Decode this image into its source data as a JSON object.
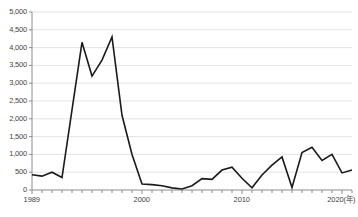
{
  "chart_data": {
    "type": "line",
    "title": "",
    "subtitle": "",
    "xlabel": "(年)",
    "ylabel": "",
    "grid": true,
    "legend": null,
    "xlim": [
      1989,
      2021
    ],
    "ylim": [
      0,
      5000
    ],
    "y_ticks": [
      0,
      500,
      1000,
      1500,
      2000,
      2500,
      3000,
      3500,
      4000,
      4500,
      5000
    ],
    "y_tick_labels": [
      "0",
      "500",
      "1,000",
      "1,500",
      "2,000",
      "2,500",
      "3,000",
      "3,500",
      "4,000",
      "4,500",
      "5,000"
    ],
    "x_tick_labels": [
      "1989",
      "2000",
      "2010",
      "2020(年)"
    ],
    "x_labeled_years": [
      1989,
      2000,
      2010,
      2020
    ],
    "x_minor_tick_interval": 1,
    "x": [
      1989,
      1990,
      1991,
      1992,
      1993,
      1994,
      1995,
      1996,
      1997,
      1998,
      1999,
      2000,
      2001,
      2002,
      2003,
      2004,
      2005,
      2006,
      2007,
      2008,
      2009,
      2010,
      2011,
      2012,
      2013,
      2014,
      2015,
      2016,
      2017,
      2018,
      2019,
      2020,
      2021
    ],
    "values": [
      430,
      390,
      500,
      350,
      2250,
      4150,
      3200,
      3650,
      4300,
      2100,
      1000,
      170,
      150,
      120,
      60,
      30,
      120,
      320,
      300,
      560,
      640,
      330,
      60,
      420,
      700,
      930,
      70,
      1050,
      1200,
      830,
      1000,
      480,
      560
    ],
    "series": [
      {
        "name": "",
        "color": "#1a1a1a",
        "values": [
          430,
          390,
          500,
          350,
          2250,
          4150,
          3200,
          3650,
          4300,
          2100,
          1000,
          170,
          150,
          120,
          60,
          30,
          120,
          320,
          300,
          560,
          640,
          330,
          60,
          420,
          700,
          930,
          70,
          1050,
          1200,
          830,
          1000,
          480,
          560
        ]
      }
    ],
    "axis_color": "#888888",
    "grid_color": "#d8d8d8",
    "line_color": "#1a1a1a",
    "line_width": 1.6
  },
  "axes": {
    "y_labels": [
      "5,000",
      "4,500",
      "4,000",
      "3,500",
      "3,000",
      "2,500",
      "2,000",
      "1,500",
      "1,000",
      "500",
      "0"
    ],
    "x_labels": [
      "1989",
      "2000",
      "2010",
      "2020(年)"
    ]
  }
}
